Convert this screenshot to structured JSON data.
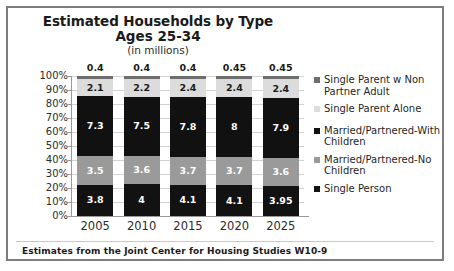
{
  "chart_data": {
    "type": "bar",
    "subtype": "100% stacked bar",
    "title": "Estimated Households by Type",
    "subtitle": "Ages 25-34",
    "units_note": "(in millions)",
    "xlabel": "",
    "ylabel": "",
    "ylim": [
      0,
      100
    ],
    "grid": true,
    "legend_position": "right",
    "categories": [
      "2005",
      "2010",
      "2015",
      "2020",
      "2025"
    ],
    "y_ticks": [
      "0%",
      "10%",
      "20%",
      "30%",
      "40%",
      "50%",
      "60%",
      "70%",
      "80%",
      "90%",
      "100%"
    ],
    "series": [
      {
        "name": "Single Person",
        "color": "#121212",
        "label_color": "#ffffff",
        "values": [
          3.8,
          4,
          4.1,
          4.1,
          3.95
        ],
        "value_labels": [
          "3.8",
          "4",
          "4.1",
          "4.1",
          "3.95"
        ]
      },
      {
        "name": "Married/Partnered-No Children",
        "color": "#9a9a9a",
        "label_color": "#ffffff",
        "values": [
          3.5,
          3.6,
          3.7,
          3.7,
          3.6
        ],
        "value_labels": [
          "3.5",
          "3.6",
          "3.7",
          "3.7",
          "3.6"
        ]
      },
      {
        "name": "Married/Partnered-With Children",
        "color": "#111111",
        "label_color": "#ffffff",
        "values": [
          7.3,
          7.5,
          7.8,
          8,
          7.9
        ],
        "value_labels": [
          "7.3",
          "7.5",
          "7.8",
          "8",
          "7.9"
        ]
      },
      {
        "name": "Single Parent Alone",
        "color": "#dcdcdc",
        "label_color": "#1b1b1b",
        "values": [
          2.1,
          2.2,
          2.4,
          2.4,
          2.4
        ],
        "value_labels": [
          "2.1",
          "2.2",
          "2.4",
          "2.4",
          "2.4"
        ]
      },
      {
        "name": "Single Parent w Non Partner Adult",
        "color": "#6e6e6e",
        "label_color": "#1b1b1b",
        "values": [
          0.4,
          0.4,
          0.4,
          0.45,
          0.45
        ],
        "value_labels": [
          "0.4",
          "0.4",
          "0.4",
          "0.45",
          "0.45"
        ]
      }
    ],
    "legend_entries": [
      {
        "label": "Single Parent w Non Partner Adult",
        "color": "#6e6e6e"
      },
      {
        "label": "Single Parent Alone",
        "color": "#dcdcdc"
      },
      {
        "label": "Married/Partnered-With Children",
        "color": "#111111"
      },
      {
        "label": "Married/Partnered-No Children",
        "color": "#9a9a9a"
      },
      {
        "label": "Single Person",
        "color": "#121212"
      }
    ],
    "source_note": "Estimates from the Joint Center for Housing Studies W10-9"
  }
}
